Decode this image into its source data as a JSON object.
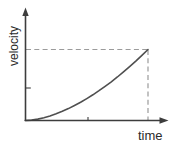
{
  "figure": {
    "y_axis_label": "velocity",
    "x_axis_label": "time"
  },
  "chart_data": {
    "type": "line",
    "title": "",
    "xlabel": "time",
    "ylabel": "velocity",
    "x_range": [
      0,
      1
    ],
    "y_range": [
      0,
      1
    ],
    "grid": false,
    "axis_numbers": "none (qualitative sketch with arrowed axes)",
    "series": [
      {
        "name": "velocity vs time",
        "shape": "concave-up increasing curve (velocity rising at an increasing rate) from origin to a final point marked by dashed projections",
        "x": [
          0,
          0.05,
          0.1,
          0.15,
          0.2,
          0.25,
          0.3,
          0.35,
          0.4,
          0.45,
          0.5,
          0.55,
          0.6,
          0.65,
          0.7,
          0.75,
          0.8,
          0.85,
          0.9,
          0.95,
          1.0
        ],
        "y": [
          0,
          0.006,
          0.02,
          0.04,
          0.065,
          0.095,
          0.129,
          0.168,
          0.211,
          0.257,
          0.308,
          0.362,
          0.42,
          0.481,
          0.545,
          0.613,
          0.684,
          0.759,
          0.836,
          0.917,
          1.0
        ]
      }
    ],
    "annotations": [
      {
        "name": "final-velocity-projection",
        "type": "horizontal-dashed-line",
        "at_y": 1.0,
        "from_x": 0,
        "to_x": 1.0
      },
      {
        "name": "final-time-projection",
        "type": "vertical-dashed-line",
        "at_x": 1.0,
        "from_y": 1.0,
        "to_y": 0
      }
    ],
    "ticks": {
      "x_axis": [
        {
          "position": 0.51,
          "label": ""
        }
      ],
      "y_axis": [
        {
          "position": 0.46,
          "label": ""
        }
      ]
    },
    "legend": "none"
  },
  "colors": {
    "background": "#ffffff",
    "axis": "#3d3d3d",
    "curve": "#4f4f4f",
    "dashed_projection": "#9b9b9b",
    "label_text": "#2b2b2b"
  }
}
